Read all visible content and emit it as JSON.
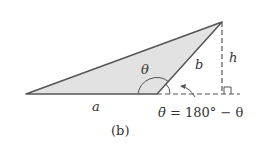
{
  "diagram": {
    "labels": {
      "theta": "θ",
      "b": "b",
      "h": "h",
      "a": "a",
      "equation_lhs": "θ̄",
      "equation_rest": " = 180° − θ",
      "caption": "(b)"
    },
    "colors": {
      "fill": "#e2e2e2",
      "stroke": "#555555"
    }
  }
}
